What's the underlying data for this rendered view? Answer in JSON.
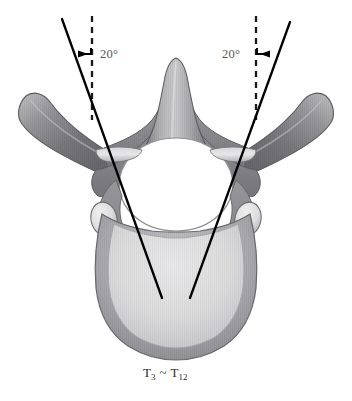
{
  "figure": {
    "caption": {
      "prefix": "T",
      "start_level": "3",
      "separator": "~",
      "end_level": "12",
      "full_text": "T3 ~ T12"
    },
    "background_color": "#ffffff"
  },
  "annotations": {
    "left_angle": {
      "label": "20°",
      "value": 20,
      "unit": "degrees",
      "side": "left",
      "text_color": "#58585a"
    },
    "right_angle": {
      "label": "20°",
      "value": 20,
      "unit": "degrees",
      "side": "right",
      "text_color": "#58585a"
    }
  },
  "guides": {
    "reference_line_style": "dashed-vertical",
    "reference_line_color": "#1a1a1a",
    "trajectory_line_style": "solid",
    "trajectory_line_color": "#000000",
    "arrow_color": "#000000"
  },
  "anatomy": {
    "structures": [
      "spinous-process",
      "left-transverse-process",
      "right-transverse-process",
      "left-lamina",
      "right-lamina",
      "vertebral-foramen",
      "left-pedicle",
      "right-pedicle",
      "left-superior-articular-facet",
      "right-superior-articular-facet",
      "vertebral-body"
    ],
    "colors": {
      "bone_dark": "#6e6e70",
      "bone_mid": "#8e8e90",
      "bone_light": "#c9c9cb",
      "bone_pale": "#dcdcde",
      "outline": "#5a5a5c",
      "foramen": "#ffffff"
    }
  }
}
